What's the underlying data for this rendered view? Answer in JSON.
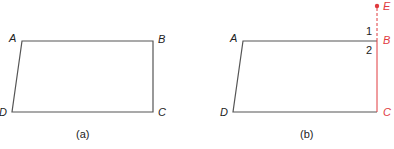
{
  "figures": [
    {
      "caption": "(a)",
      "vertices": {
        "A": "A",
        "B": "B",
        "C": "C",
        "D": "D"
      }
    },
    {
      "caption": "(b)",
      "vertices": {
        "A": "A",
        "B": "B",
        "C": "C",
        "D": "D",
        "E": "E"
      },
      "angles": {
        "one": "1",
        "two": "2"
      }
    }
  ],
  "colors": {
    "line": "#555555",
    "accent": "#e03a3e"
  }
}
